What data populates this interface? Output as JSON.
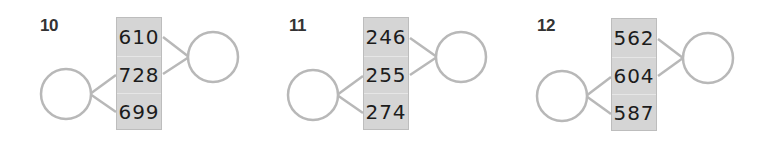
{
  "problems": [
    {
      "number": "10",
      "values": [
        "610",
        "728",
        "699"
      ],
      "left_circle": {
        "connects_to_rows": [
          2,
          3
        ],
        "answer": ""
      },
      "right_circle": {
        "connects_to_rows": [
          1,
          2
        ],
        "answer": ""
      }
    },
    {
      "number": "11",
      "values": [
        "246",
        "255",
        "274"
      ],
      "left_circle": {
        "connects_to_rows": [
          2,
          3
        ],
        "answer": ""
      },
      "right_circle": {
        "connects_to_rows": [
          1,
          2
        ],
        "answer": ""
      }
    },
    {
      "number": "12",
      "values": [
        "562",
        "604",
        "587"
      ],
      "left_circle": {
        "connects_to_rows": [
          2,
          3
        ],
        "answer": ""
      },
      "right_circle": {
        "connects_to_rows": [
          1,
          2
        ],
        "answer": ""
      }
    }
  ],
  "colors": {
    "box_fill": "#d5d5d5",
    "box_border": "#bdbdbd",
    "line": "#b8b8b8",
    "label": "#333333",
    "number_text": "#1c1c1c"
  }
}
